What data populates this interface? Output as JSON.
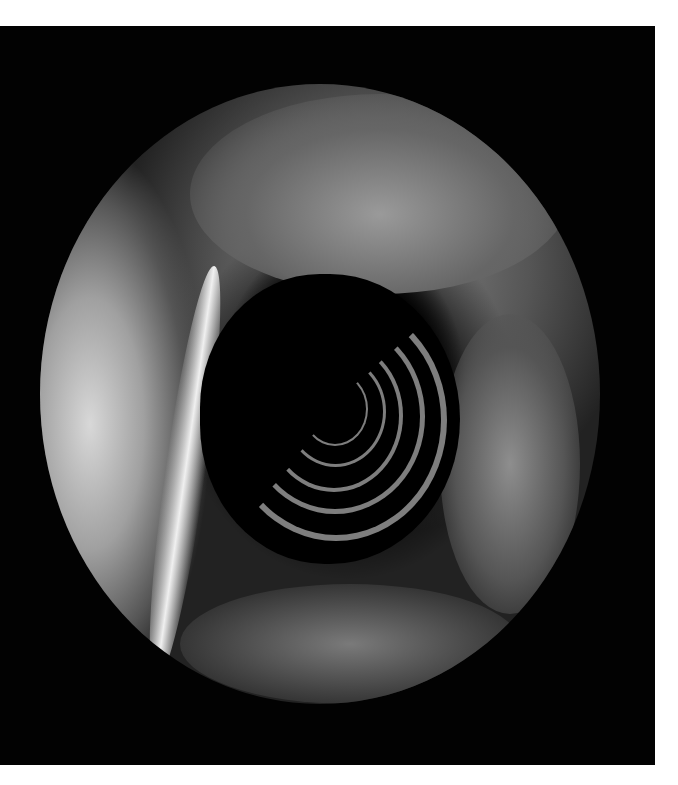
{
  "image": {
    "description": "Grayscale endoscopic view of a tubular lumen with concentric circular folds inside a circular field of view on a black rectangular frame",
    "frame_color": "#020202",
    "background_color": "#ffffff"
  }
}
